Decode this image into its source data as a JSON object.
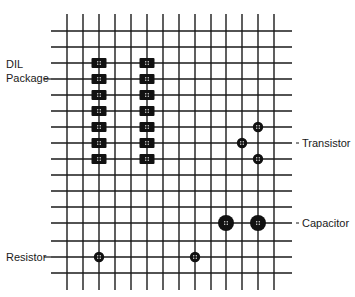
{
  "diagram": {
    "type": "perfboard-component-layout",
    "grid": {
      "vertical_x": [
        67,
        83,
        99,
        115,
        131,
        147,
        163,
        179,
        195,
        211,
        226,
        242,
        258,
        274
      ],
      "vertical_y_range": [
        14,
        290
      ],
      "horizontal_y": [
        31,
        47,
        63,
        79,
        95,
        111,
        127,
        143,
        159,
        175,
        191,
        207,
        223,
        241,
        257,
        273
      ],
      "horizontal_x_range": [
        51,
        292
      ],
      "line_color": "#1a1a1a"
    },
    "labels": [
      {
        "id": "dil-label-line1",
        "text": "DIL",
        "x": 6,
        "y": 58
      },
      {
        "id": "dil-label-line2",
        "text": "Package",
        "x": 6,
        "y": 72
      },
      {
        "id": "transistor-label",
        "text": "Transistor",
        "x": 302,
        "y": 137
      },
      {
        "id": "capacitor-label",
        "text": "Capacitor",
        "x": 302,
        "y": 217
      },
      {
        "id": "resistor-label",
        "text": "Resistor",
        "x": 6,
        "y": 251
      }
    ],
    "components": {
      "dil_package": {
        "pad_shape": "rect",
        "pads": [
          {
            "x": 99,
            "y": 63
          },
          {
            "x": 99,
            "y": 79
          },
          {
            "x": 99,
            "y": 95
          },
          {
            "x": 99,
            "y": 111
          },
          {
            "x": 99,
            "y": 127
          },
          {
            "x": 99,
            "y": 143
          },
          {
            "x": 99,
            "y": 159
          },
          {
            "x": 147,
            "y": 63
          },
          {
            "x": 147,
            "y": 79
          },
          {
            "x": 147,
            "y": 95
          },
          {
            "x": 147,
            "y": 111
          },
          {
            "x": 147,
            "y": 127
          },
          {
            "x": 147,
            "y": 143
          },
          {
            "x": 147,
            "y": 159
          }
        ]
      },
      "transistor": {
        "pad_shape": "circle-small",
        "pads": [
          {
            "x": 258,
            "y": 127
          },
          {
            "x": 242,
            "y": 143
          },
          {
            "x": 258,
            "y": 159
          }
        ]
      },
      "capacitor": {
        "pad_shape": "circle-large",
        "pads": [
          {
            "x": 226,
            "y": 223
          },
          {
            "x": 258,
            "y": 223
          }
        ]
      },
      "resistor": {
        "pad_shape": "circle-small",
        "pads": [
          {
            "x": 99,
            "y": 257
          },
          {
            "x": 195,
            "y": 257
          }
        ]
      }
    }
  }
}
